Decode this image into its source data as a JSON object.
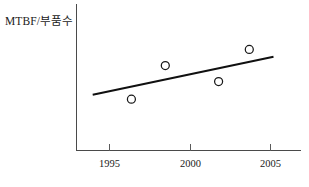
{
  "chart_data": {
    "type": "scatter",
    "title": "",
    "xlabel": "",
    "ylabel": "MTBF/부품수",
    "xlim": [
      1993.0,
      2006.9
    ],
    "ylim": [
      0,
      100
    ],
    "grid": false,
    "legend": null,
    "x_ticks": [
      {
        "value": 1995,
        "label": "1995"
      },
      {
        "value": 2000,
        "label": "2000"
      },
      {
        "value": 2005,
        "label": "2005"
      }
    ],
    "y_ticks": [],
    "y_tick_labels_shown": false,
    "series": [
      {
        "name": "MTBF per part count",
        "type": "scatter",
        "marker": "open-circle",
        "marker_size": 8,
        "points": [
          {
            "x": 1996.4,
            "y": 35
          },
          {
            "x": 1998.5,
            "y": 58
          },
          {
            "x": 2001.8,
            "y": 47
          },
          {
            "x": 2003.7,
            "y": 69
          }
        ]
      },
      {
        "name": "Trend line",
        "type": "line",
        "points": [
          {
            "x": 1994.0,
            "y": 38
          },
          {
            "x": 2005.2,
            "y": 64
          }
        ]
      }
    ]
  },
  "axis": {
    "x_axis_label": "",
    "y_axis_label": "MTBF/부품수"
  },
  "colors": {
    "axis": "#4a4a4a",
    "trend_line": "#101010",
    "marker_stroke": "#181818",
    "marker_fill": "#ffffff",
    "background": "#ffffff",
    "text": "#1a1a1a"
  }
}
